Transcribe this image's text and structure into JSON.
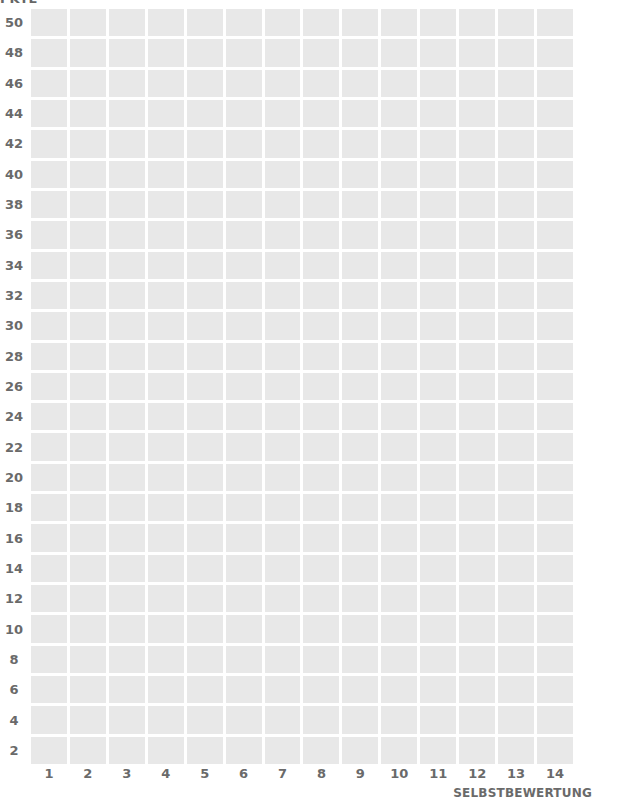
{
  "chart_data": {
    "type": "table",
    "title": "",
    "xlabel": "SELBSTBEWERTUNG",
    "ylabel": "",
    "x": [
      1,
      2,
      3,
      4,
      5,
      6,
      7,
      8,
      9,
      10,
      11,
      12,
      13,
      14
    ],
    "y_ticks": [
      50,
      48,
      46,
      44,
      42,
      40,
      38,
      36,
      34,
      32,
      30,
      28,
      26,
      24,
      22,
      20,
      18,
      16,
      14,
      12,
      10,
      8,
      6,
      4,
      2
    ],
    "rows": 25,
    "columns": 14,
    "grid": true,
    "series": [],
    "cell_color": "#e8e8e8",
    "label_color": "#6a6a6a"
  },
  "top_label_cut": "PKTE"
}
